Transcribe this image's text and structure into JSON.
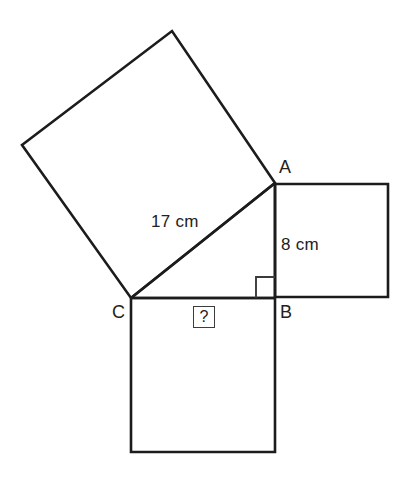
{
  "figure": {
    "background_color": "#ffffff",
    "stroke_color": "#1c1c1c",
    "text_color": "#222222",
    "vertices": {
      "a_label": "A",
      "b_label": "B",
      "c_label": "C"
    },
    "measures": {
      "hypotenuse_label": "17 cm",
      "leg_label": "8 cm",
      "unknown_label": "?"
    },
    "markers": {
      "right_angle": "right-angle-marker"
    }
  },
  "chart_data": {
    "type": "diagram",
    "subtype": "geometry-pythagorean",
    "units": "cm",
    "points": {
      "A": [
        275,
        183
      ],
      "B": [
        275,
        298
      ],
      "C": [
        131,
        298
      ]
    },
    "triangle": {
      "vertices": [
        "A",
        "B",
        "C"
      ],
      "right_angle_at": "B",
      "sides": [
        {
          "name": "AC",
          "role": "hypotenuse",
          "label": "17 cm",
          "value": 17
        },
        {
          "name": "AB",
          "role": "leg",
          "label": "8 cm",
          "value": 8
        },
        {
          "name": "BC",
          "role": "leg",
          "label": "?",
          "value": null
        }
      ]
    },
    "squares": [
      {
        "name": "square-on-AC",
        "side": "AC",
        "orientation": "tilted",
        "polygon": [
          [
            275,
            183
          ],
          [
            172,
            31
          ],
          [
            22,
            145
          ],
          [
            131,
            298
          ]
        ]
      },
      {
        "name": "square-on-AB",
        "side": "AB",
        "orientation": "axis-aligned",
        "polygon": [
          [
            275,
            184
          ],
          [
            388,
            184
          ],
          [
            388,
            297
          ],
          [
            275,
            297
          ]
        ]
      },
      {
        "name": "square-on-BC",
        "side": "BC",
        "orientation": "axis-aligned",
        "polygon": [
          [
            131,
            298
          ],
          [
            275,
            298
          ],
          [
            275,
            452
          ],
          [
            131,
            452
          ]
        ]
      }
    ],
    "right_angle_marker": {
      "at": "B",
      "polygon": [
        [
          256,
          298
        ],
        [
          256,
          277
        ],
        [
          275,
          277
        ]
      ]
    },
    "annotations": [
      {
        "text": "17 cm",
        "position": [
          151,
          213
        ],
        "refers_to": "AC"
      },
      {
        "text": "8 cm",
        "position": [
          281,
          236
        ],
        "refers_to": "AB"
      },
      {
        "text": "?",
        "position": [
          193,
          306
        ],
        "refers_to": "BC",
        "boxed": true
      },
      {
        "text": "A",
        "position": [
          279,
          158
        ],
        "refers_to": "vertex-A"
      },
      {
        "text": "B",
        "position": [
          280,
          303
        ],
        "refers_to": "vertex-B"
      },
      {
        "text": "C",
        "position": [
          112,
          303
        ],
        "refers_to": "vertex-C"
      }
    ]
  }
}
